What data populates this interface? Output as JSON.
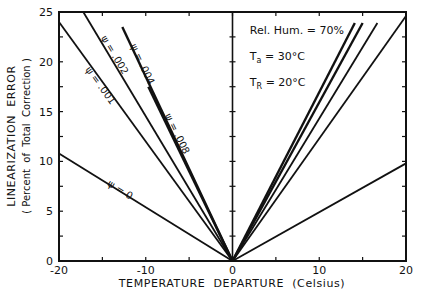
{
  "chart_data": {
    "type": "line",
    "title": "",
    "xlabel": "TEMPERATURE  DEPARTURE  (Celsius)",
    "ylabel": "LINEARIZATION  ERROR",
    "ylabel_sub": "( Percent  of  Total  Correction )",
    "xlim": [
      -20,
      20
    ],
    "ylim": [
      0,
      25
    ],
    "x_ticks": [
      -20,
      -10,
      0,
      10,
      20
    ],
    "x_tick_labels": [
      "-20",
      "-10",
      "0",
      "10",
      "20"
    ],
    "y_ticks": [
      0,
      5,
      10,
      15,
      20,
      25
    ],
    "y_tick_labels": [
      "0",
      "5",
      "10",
      "15",
      "20",
      "25"
    ],
    "grid": false,
    "legend_position": "none",
    "annotations": [
      {
        "text": "Rel. Hum. = 70%",
        "x": 2,
        "y": 22.8
      },
      {
        "text": "Ta = 30°C",
        "x": 2,
        "y": 20.2
      },
      {
        "text": "TR = 20°C",
        "x": 2,
        "y": 17.6
      }
    ],
    "series": [
      {
        "name": "ψ = 0",
        "label": "ψ = 0",
        "side": "left",
        "x": [
          -20,
          0
        ],
        "y": [
          10.8,
          0
        ],
        "label_x": -14.5,
        "label_y": 7.6
      },
      {
        "name": "ψ = 0.001",
        "label": "ψ = 0.001",
        "side": "left",
        "x": [
          -20,
          0
        ],
        "y": [
          24.0,
          0
        ],
        "label_x": -17.0,
        "label_y": 19.2
      },
      {
        "name": "ψ = 0.002",
        "label": "ψ = 0.002",
        "side": "left",
        "x": [
          -17.2,
          0
        ],
        "y": [
          25.0,
          0
        ],
        "label_x": -15.2,
        "label_y": 22.4
      },
      {
        "name": "ψ = 0.004",
        "label": "ψ = 0.004",
        "side": "left",
        "x": [
          -12.7,
          0
        ],
        "y": [
          23.5,
          0
        ],
        "label_x": -11.8,
        "label_y": 21.6
      },
      {
        "name": "ψ = 0.008",
        "label": "ψ = 0.008",
        "side": "left",
        "x": [
          -9.7,
          0
        ],
        "y": [
          17.5,
          0
        ],
        "label_x": -7.8,
        "label_y": 14.6
      },
      {
        "name": "ψ = 0 (positive)",
        "side": "right",
        "x": [
          0,
          20
        ],
        "y": [
          0,
          9.8
        ]
      },
      {
        "name": "ψ = 0.001 (positive)",
        "side": "right",
        "x": [
          0,
          20
        ],
        "y": [
          0,
          24.6
        ]
      },
      {
        "name": "ψ = 0.002 (positive)",
        "side": "right",
        "x": [
          0,
          16.7
        ],
        "y": [
          0,
          23.9
        ]
      },
      {
        "name": "ψ = 0.004 (positive)",
        "side": "right",
        "x": [
          0,
          15.0
        ],
        "y": [
          0,
          23.9
        ]
      },
      {
        "name": "ψ = 0.008 (positive)",
        "side": "right",
        "x": [
          0,
          14.1
        ],
        "y": [
          0,
          23.9
        ]
      }
    ]
  }
}
